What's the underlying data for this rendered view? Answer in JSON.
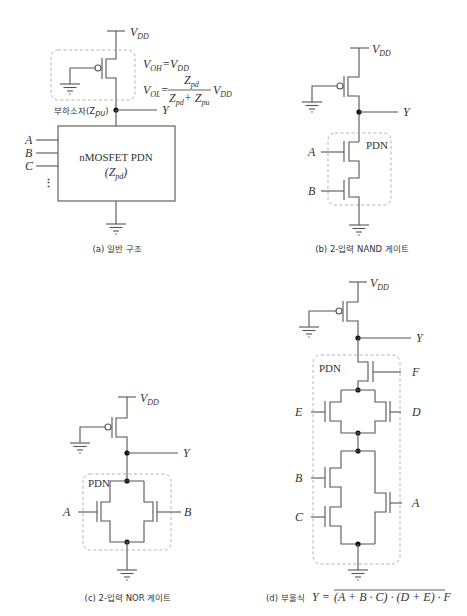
{
  "panels": {
    "a": {
      "caption": "(a) 일반 구조",
      "vdd_label": "V",
      "vdd_sub": "DD",
      "voh_lhs": "V",
      "voh_lhs_sub": "OH",
      "voh_eq": "=",
      "voh_rhs": "V",
      "voh_rhs_sub": "DD",
      "vol_lhs": "V",
      "vol_lhs_sub": "OL",
      "vol_eq": "=",
      "vol_num": "Z",
      "vol_num_sub": "pd",
      "vol_den": "Z",
      "vol_den_sub1": "pd",
      "vol_den_plus": "+ Z",
      "vol_den_sub2": "pu",
      "vol_tail": "V",
      "vol_tail_sub": "DD",
      "load_label": "부하소자(Z",
      "load_sub": "pu",
      "load_close": ")",
      "output": "Y",
      "inputs": [
        "A",
        "B",
        "C"
      ],
      "ellipsis": "⋮",
      "block_title": "nMOSFET PDN",
      "block_sub_open": "(Z",
      "block_sub_sub": "pd",
      "block_sub_close": ")"
    },
    "b": {
      "caption": "(b) 2-입력 NAND 게이트",
      "vdd_label": "V",
      "vdd_sub": "DD",
      "output": "Y",
      "pdn_label": "PDN",
      "inputs": [
        "A",
        "B"
      ]
    },
    "c": {
      "caption": "(c) 2-입력 NOR 게이트",
      "vdd_label": "V",
      "vdd_sub": "DD",
      "output": "Y",
      "pdn_label": "PDN",
      "inputs": [
        "A",
        "B"
      ]
    },
    "d": {
      "caption_prefix": "(d) 부울식",
      "caption_expr_lhs": "Y =",
      "caption_expr_rhs": "(A + B · C) · (D + E) · F",
      "vdd_label": "V",
      "vdd_sub": "DD",
      "output": "Y",
      "pdn_label": "PDN",
      "inputs": [
        "F",
        "E",
        "D",
        "B",
        "C",
        "A"
      ]
    }
  }
}
